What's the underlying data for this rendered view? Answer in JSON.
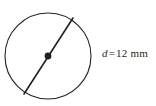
{
  "figure": {
    "background_color": "#ffffff",
    "stroke_color": "#231f20",
    "label": {
      "variable": "d",
      "equals": "=",
      "value": "12",
      "unit": "mm",
      "full_text": "d = 12 mm"
    },
    "shapes": {
      "circle": {
        "name": "circle-outline",
        "center_x": 48,
        "center_y": 56,
        "radius": 43,
        "stroke_width": 1.1
      },
      "center_point": {
        "name": "center-dot",
        "x": 48,
        "y": 56,
        "radius": 3.4
      },
      "diameter_line": {
        "name": "diameter-segment",
        "x1": 73,
        "y1": 18,
        "x2": 24,
        "y2": 94,
        "stroke_width": 1.6
      }
    }
  }
}
